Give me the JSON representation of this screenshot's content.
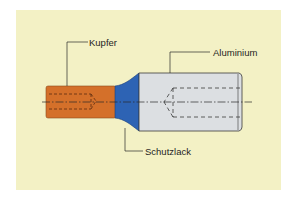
{
  "diagram": {
    "labels": {
      "copper": "Kupfer",
      "aluminium": "Aluminium",
      "coating": "Schutzlack"
    },
    "colors": {
      "panel": "#f3f1c5",
      "copper": "#d4702a",
      "coating": "#2d63b4",
      "aluminium": "#dcdfe2",
      "outline": "#3a3a3a"
    }
  }
}
